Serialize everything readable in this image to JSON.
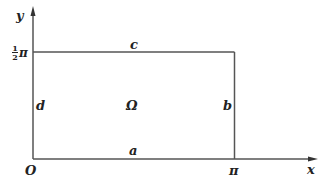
{
  "diagram": {
    "type": "rectangular-domain",
    "colors": {
      "line": "#555555",
      "text": "#222222",
      "background": "#ffffff"
    },
    "axes": {
      "x_label": "x",
      "y_label": "y",
      "origin_label": "O"
    },
    "ticks": {
      "x_tick": "π",
      "y_tick_num": "1",
      "y_tick_den": "2",
      "y_tick_symbol": "π"
    },
    "edges": {
      "bottom": "a",
      "right": "b",
      "top": "c",
      "left": "d"
    },
    "region_label": "Ω"
  }
}
